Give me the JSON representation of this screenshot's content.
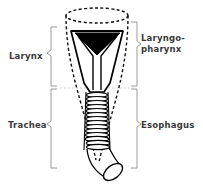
{
  "figure": {
    "background_color": "#ffffff",
    "ink_color": "#000000",
    "label_color": "#3a3a3a",
    "bracket_color": "#9a9a9a",
    "glottis_fill": "#000000",
    "structures": {
      "esophagus_outline": "dashed",
      "larynx_outline": "solid",
      "trachea_rings": 14,
      "trachea_bend_direction": "lower-right"
    }
  },
  "labels": {
    "larynx": "Larynx",
    "trachea": "Trachea",
    "laryngopharynx_line1": "Laryngo-",
    "laryngopharynx_line2": "pharynx",
    "esophagus": "Esophagus"
  }
}
